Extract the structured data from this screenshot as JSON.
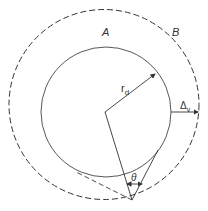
{
  "diagram": {
    "labels": {
      "region_a": "A",
      "region_b": "B",
      "radius": "r",
      "radius_sub": "d",
      "delta": "Δ",
      "delta_sub": "v",
      "angle": "θ"
    },
    "colors": {
      "stroke": "#333333",
      "background": "#ffffff"
    }
  }
}
